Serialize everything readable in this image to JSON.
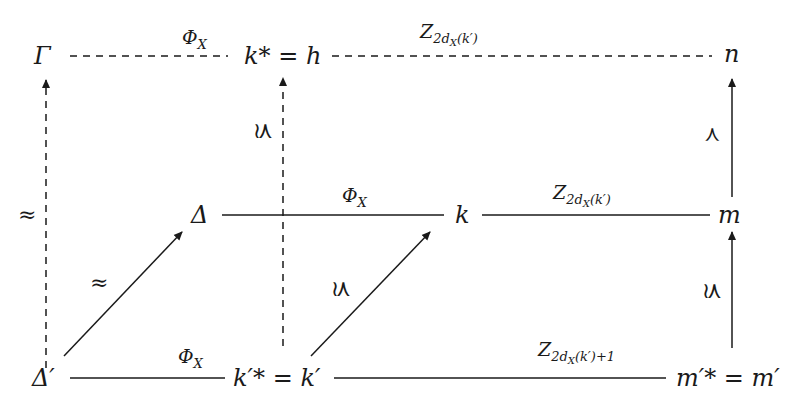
{
  "diagram": {
    "nodes": {
      "gamma": "Γ",
      "kstar_eq_h": {
        "lhs": "k*",
        "eq": "=",
        "rhs": "h"
      },
      "n": "n",
      "delta": "Δ",
      "k": "k",
      "m": "m",
      "delta_prime": "Δ′",
      "kprimestar_eq_kprime": {
        "lhs": "k′*",
        "eq": "=",
        "rhs": "k′"
      },
      "mprimestar_eq_mprime": {
        "lhs": "m′*",
        "eq": "=",
        "rhs": "m′"
      }
    },
    "edge_labels": {
      "phi": {
        "main": "Φ",
        "sub": "X"
      },
      "z_top": {
        "main": "Z",
        "sub": "2d",
        "subsub": "X",
        "arg": "(k′)"
      },
      "z_mid": {
        "main": "Z",
        "sub": "2d",
        "subsub": "X",
        "arg": "(k′)"
      },
      "z_bottom": {
        "main": "Z",
        "sub": "2d",
        "subsub": "X",
        "arg": "(k′)+1"
      },
      "approx": "≈",
      "precsim": "≾"
    },
    "edges": [
      {
        "from": "Γ",
        "to": "k* = h",
        "label": "Φ_X",
        "style": "dashed"
      },
      {
        "from": "k* = h",
        "to": "n",
        "label": "Z_{2d_X(k′)}",
        "style": "dashed"
      },
      {
        "from": "Δ",
        "to": "k",
        "label": "Φ_X",
        "style": "solid"
      },
      {
        "from": "k",
        "to": "m",
        "label": "Z_{2d_X(k′)}",
        "style": "solid"
      },
      {
        "from": "Δ′",
        "to": "k′* = k′",
        "label": "Φ_X",
        "style": "solid"
      },
      {
        "from": "k′* = k′",
        "to": "m′* = m′",
        "label": "Z_{2d_X(k′)+1}",
        "style": "solid"
      },
      {
        "from": "Δ′",
        "to": "Γ",
        "label": "≈",
        "style": "dashed-arrow"
      },
      {
        "from": "Δ′",
        "to": "Δ",
        "label": "≈",
        "style": "arrow"
      },
      {
        "from": "k′* = k′",
        "to": "k* = h",
        "label": "≾",
        "style": "dashed-arrow"
      },
      {
        "from": "k′* = k′",
        "to": "k",
        "label": "≾",
        "style": "arrow"
      },
      {
        "from": "m",
        "to": "n",
        "label": "≺",
        "style": "arrow"
      },
      {
        "from": "m′* = m′",
        "to": "m",
        "label": "≾",
        "style": "arrow"
      }
    ],
    "colors": {
      "ink": "#1a1a1a",
      "background": "#ffffff"
    }
  }
}
